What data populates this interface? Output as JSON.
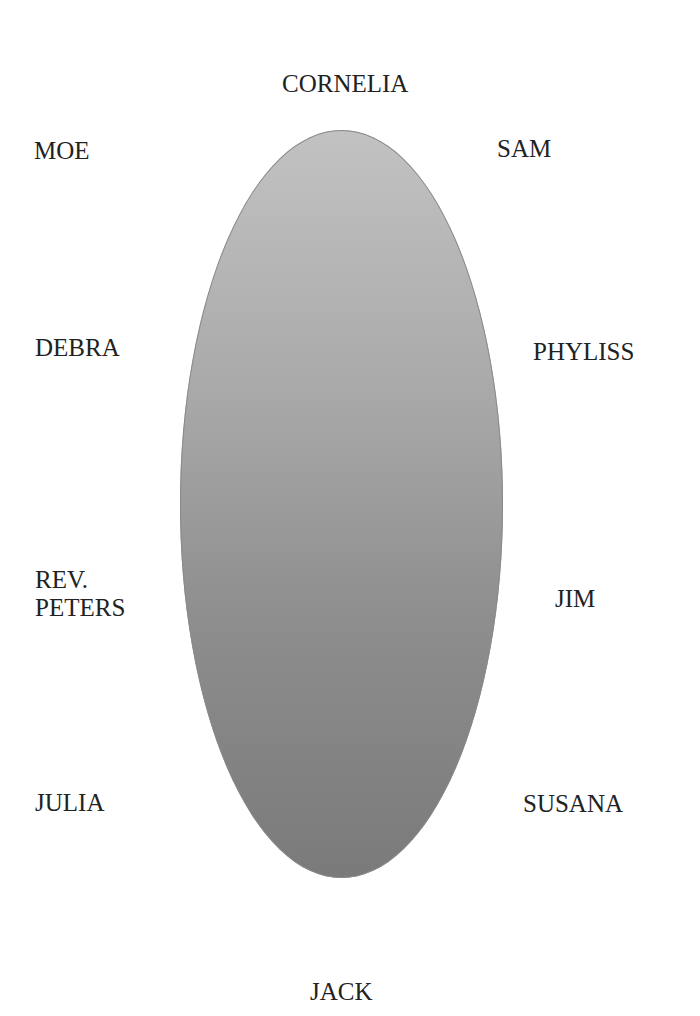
{
  "diagram": {
    "type": "seating-chart",
    "table": {
      "shape": "ellipse",
      "fill_top": "#c2c2c2",
      "fill_bottom": "#7a7a7a"
    },
    "seats": {
      "head_top": "CORNELIA",
      "left_1": "MOE",
      "right_1": "SAM",
      "left_2": "DEBRA",
      "right_2": "PHYLISS",
      "left_3_line1": "REV.",
      "left_3_line2": "PETERS",
      "right_3": "JIM",
      "left_4": "JULIA",
      "right_4": "SUSANA",
      "foot_bottom": "JACK"
    }
  }
}
